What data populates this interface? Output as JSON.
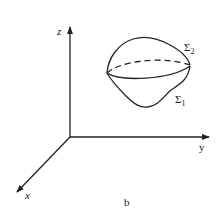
{
  "figure": {
    "caption": "b",
    "axes": {
      "x_label": "x",
      "y_label": "y",
      "z_label": "z"
    },
    "surfaces": [
      {
        "label": "Σ",
        "subscript": "2",
        "description": "upper surface"
      },
      {
        "label": "Σ",
        "subscript": "1",
        "description": "lower surface"
      }
    ],
    "colors": {
      "line": "#222222",
      "background": "#ffffff"
    }
  }
}
